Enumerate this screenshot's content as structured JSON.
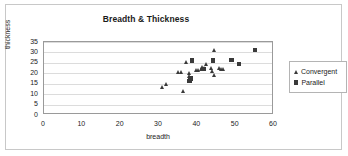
{
  "chart_data": {
    "type": "scatter",
    "title": "Breadth & Thickness",
    "xlabel": "breadth",
    "ylabel": "thickness",
    "xlim": [
      0,
      60
    ],
    "ylim": [
      0,
      35
    ],
    "xticks": [
      0,
      10,
      20,
      30,
      40,
      50,
      60
    ],
    "yticks": [
      0,
      5,
      10,
      15,
      20,
      25,
      30,
      35
    ],
    "grid": "horizontal",
    "legend_position": "right",
    "marker_color": "#3a3a3a",
    "series": [
      {
        "name": "Convergent",
        "marker": "triangle",
        "points": [
          [
            31.0,
            13.5
          ],
          [
            31.9,
            14.9
          ],
          [
            35.2,
            20.5
          ],
          [
            36.0,
            20.4
          ],
          [
            36.3,
            11.3
          ],
          [
            37.2,
            25.4
          ],
          [
            37.9,
            19.9
          ],
          [
            38.1,
            18.6
          ],
          [
            39.8,
            21.3
          ],
          [
            40.4,
            21.5
          ],
          [
            41.0,
            22.1
          ],
          [
            41.3,
            23.0
          ],
          [
            41.9,
            22.2
          ],
          [
            42.3,
            24.3
          ],
          [
            43.8,
            22.6
          ],
          [
            44.1,
            20.9
          ],
          [
            44.4,
            19.2
          ],
          [
            44.5,
            30.8
          ],
          [
            45.9,
            22.3
          ],
          [
            46.4,
            21.9
          ],
          [
            46.8,
            22.1
          ]
        ]
      },
      {
        "name": "Parallel",
        "marker": "square",
        "points": [
          [
            38.0,
            16.2
          ],
          [
            38.2,
            17.5
          ],
          [
            38.6,
            26.1
          ],
          [
            41.8,
            22.0
          ],
          [
            44.1,
            26.2
          ],
          [
            48.9,
            26.3
          ],
          [
            50.9,
            24.4
          ],
          [
            55.0,
            31.1
          ]
        ]
      }
    ]
  }
}
